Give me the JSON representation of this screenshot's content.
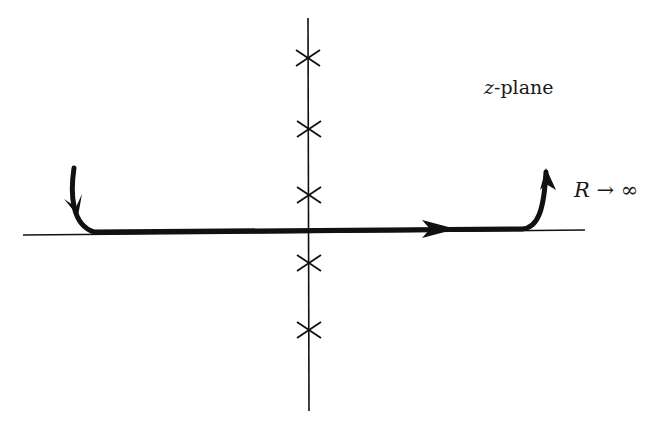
{
  "diagram": {
    "plane_label_var": "z",
    "plane_label_suffix": "-plane",
    "limit_label": "R → ∞",
    "colors": {
      "stroke": "#111111",
      "background": "#ffffff"
    },
    "real_axis": {
      "x1": 23,
      "y1": 235,
      "x2": 585,
      "y2": 230
    },
    "imag_axis": {
      "x": 308,
      "y1": 18,
      "y2": 411
    },
    "poles": [
      {
        "x": 308,
        "y": 58
      },
      {
        "x": 309,
        "y": 129
      },
      {
        "x": 309,
        "y": 195
      },
      {
        "x": 309,
        "y": 263
      },
      {
        "x": 309,
        "y": 330
      }
    ],
    "contour": {
      "description": "Indented contour along real axis with vertical ends going to infinity",
      "direction": "left-to-right"
    }
  }
}
